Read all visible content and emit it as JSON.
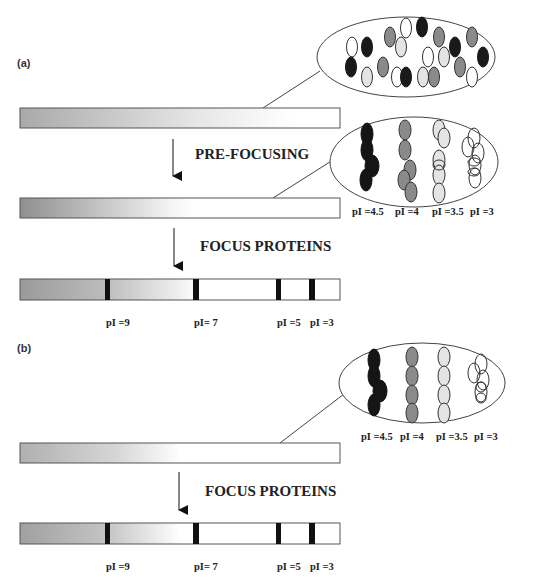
{
  "colors": {
    "black": "#1a1a1a",
    "gray": "#8a8a8a",
    "light": "#e4e4e4",
    "white": "#ffffff",
    "outline": "#444444",
    "gradient_dark": "#8f8f8f",
    "gradient_light": "#ffffff"
  },
  "panel_a": {
    "label": "(a)",
    "step1_label": "PRE-FOCUSING",
    "step2_label": "FOCUS PROTEINS",
    "prefocus_ellipse_labels": [
      "pI =4.5",
      "pI =4",
      "pI =3.5",
      "pI =3"
    ],
    "focused_band_labels": [
      "pI =9",
      "pI= 7",
      "pI =5",
      "pI =3"
    ]
  },
  "panel_b": {
    "label": "(b)",
    "step1_label": "FOCUS PROTEINS",
    "ellipse_labels": [
      "pI =4.5",
      "pI =4",
      "pI =3.5",
      "pI =3"
    ],
    "focused_band_labels": [
      "pI =9",
      "pI= 7",
      "pI =5",
      "pI =3"
    ]
  },
  "mixed_proteins": [
    {
      "x": 352,
      "y": 47,
      "c": "white"
    },
    {
      "x": 367,
      "y": 47,
      "c": "black"
    },
    {
      "x": 390,
      "y": 37,
      "c": "gray"
    },
    {
      "x": 406,
      "y": 28,
      "c": "white"
    },
    {
      "x": 401,
      "y": 47,
      "c": "light"
    },
    {
      "x": 351,
      "y": 67,
      "c": "black"
    },
    {
      "x": 367,
      "y": 77,
      "c": "light"
    },
    {
      "x": 383,
      "y": 67,
      "c": "gray"
    },
    {
      "x": 397,
      "y": 77,
      "c": "white"
    },
    {
      "x": 406,
      "y": 77,
      "c": "black"
    },
    {
      "x": 422,
      "y": 27,
      "c": "black"
    },
    {
      "x": 439,
      "y": 37,
      "c": "gray"
    },
    {
      "x": 472,
      "y": 37,
      "c": "gray"
    },
    {
      "x": 455,
      "y": 47,
      "c": "black"
    },
    {
      "x": 428,
      "y": 57,
      "c": "white"
    },
    {
      "x": 444,
      "y": 57,
      "c": "light"
    },
    {
      "x": 483,
      "y": 57,
      "c": "black"
    },
    {
      "x": 460,
      "y": 67,
      "c": "gray"
    },
    {
      "x": 472,
      "y": 77,
      "c": "white"
    },
    {
      "x": 423,
      "y": 77,
      "c": "light"
    },
    {
      "x": 434,
      "y": 77,
      "c": "gray"
    }
  ]
}
